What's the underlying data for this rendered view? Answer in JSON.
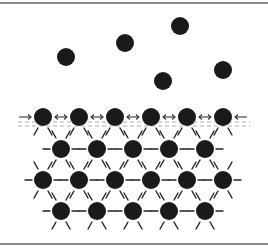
{
  "colors": {
    "particle": "#1a1a1a",
    "frame": "#8a8a8a",
    "bond": "#222222",
    "background": "#ffffff"
  },
  "frame": {
    "top_y": 3,
    "bottom_y": 244
  },
  "particle_radius": 9,
  "gas_particles": [
    {
      "x": 66,
      "y": 57
    },
    {
      "x": 125,
      "y": 43
    },
    {
      "x": 180,
      "y": 26
    },
    {
      "x": 163,
      "y": 81
    },
    {
      "x": 223,
      "y": 70
    }
  ],
  "surface_row": {
    "y": 117,
    "xs": [
      43,
      79,
      115,
      151,
      187,
      223
    ]
  },
  "lattice_rows": [
    {
      "y": 149,
      "xs": [
        61,
        97,
        133,
        169,
        205
      ]
    },
    {
      "y": 180,
      "xs": [
        43,
        79,
        115,
        151,
        187,
        223
      ]
    },
    {
      "y": 211,
      "xs": [
        61,
        97,
        133,
        169,
        205
      ]
    }
  ],
  "surface_arrows": {
    "left_edge": "→",
    "between": "⇔",
    "right_edge": "←"
  }
}
